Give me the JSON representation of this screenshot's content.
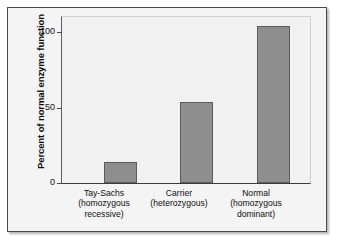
{
  "chart_data": {
    "type": "bar",
    "title": "",
    "xlabel": "",
    "ylabel": "Percent of normal enzyme function",
    "ylim": [
      0,
      110
    ],
    "yticks": [
      0,
      50,
      100
    ],
    "ytick_labels": [
      "0",
      "50",
      "100"
    ],
    "grid": false,
    "legend": false,
    "categories": [
      "Tay-Sachs\n(homozygous\nrecessive)",
      "Carrier\n(heterozygous)",
      "Normal\n(homozygous\ndominant)"
    ],
    "category_names": [
      "Tay-Sachs",
      "Carrier",
      "Normal"
    ],
    "category_genotypes": [
      "homozygous recessive",
      "heterozygous",
      "homozygous dominant"
    ],
    "values": [
      14,
      54,
      104
    ],
    "bar_color": "#8e8e8e",
    "bar_edge_color": "#5b5b5b",
    "plot_background": "#f1f1f1",
    "figure_background": "#f4f4f4",
    "frame_color": "#4a4a4a"
  }
}
